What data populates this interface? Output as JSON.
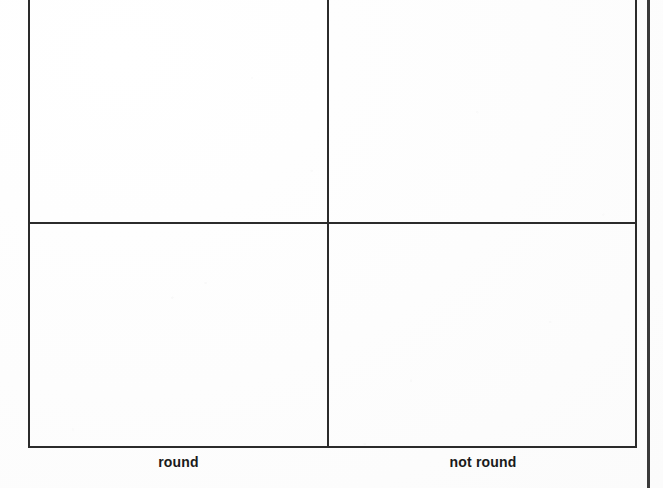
{
  "page": {
    "background_color": "#fdfdfd",
    "line_color": "#2b2b2b",
    "text_color": "#1a1a1a",
    "edge_line_color": "#3a3a3a"
  },
  "grid": {
    "name": "classification-matrix",
    "columns": 2,
    "rows": 2,
    "cells": [
      {
        "row": 0,
        "col": 0,
        "content": ""
      },
      {
        "row": 0,
        "col": 1,
        "content": ""
      },
      {
        "row": 1,
        "col": 0,
        "content": ""
      },
      {
        "row": 1,
        "col": 1,
        "content": ""
      }
    ],
    "column_captions": [
      {
        "label": "round"
      },
      {
        "label": "not round"
      }
    ],
    "row_label_fragment": "e"
  }
}
